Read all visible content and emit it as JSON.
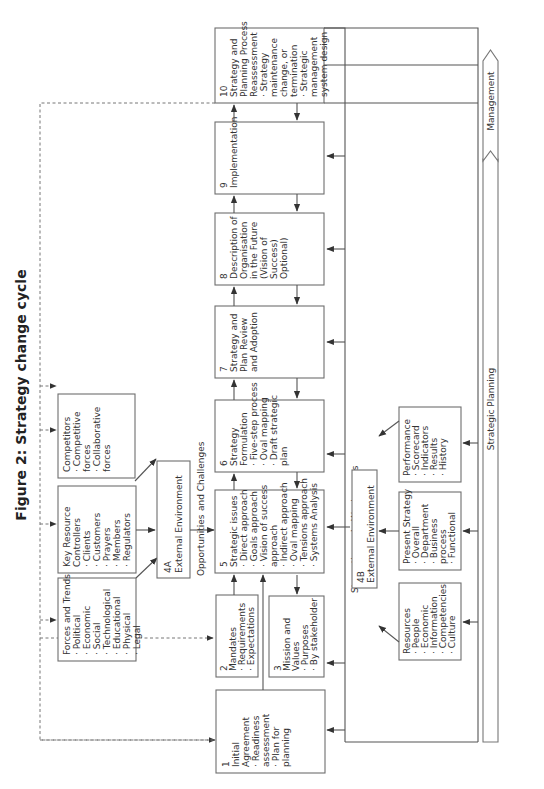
{
  "title": "Figure 2: Strategy change cycle",
  "boxes": {
    "b1": {
      "num": "1",
      "lines": [
        "Initial",
        "Agreement",
        "· Readiness",
        "  assessment",
        "· Plan for",
        "  planning"
      ]
    },
    "b2": {
      "num": "2",
      "lines": [
        "Mandates",
        "· Requirements",
        "· Expectations"
      ]
    },
    "b3": {
      "num": "3",
      "lines": [
        "Mission and",
        "Values",
        "· Purposes",
        "· By stakeholder"
      ]
    },
    "b4a": {
      "num": "4A",
      "lines": [
        "External Environment"
      ]
    },
    "b4b": {
      "num": "4B",
      "lines": [
        "External Environment"
      ]
    },
    "b5": {
      "num": "5",
      "lines": [
        "Strategic issues",
        "· Direct approach",
        "· Goals approach",
        "· Vision of success",
        "  approach",
        "· Indirect approach",
        "· Oval mapping",
        "· Tensions approach",
        "· Systems Analysis"
      ]
    },
    "b6": {
      "num": "6",
      "lines": [
        "Strategy",
        "Formulation",
        "· Five-step process",
        "· Oval mapping",
        "· Draft strategic",
        "  plan"
      ]
    },
    "b7": {
      "num": "7",
      "lines": [
        "Strategy and",
        "Plan Review",
        "and Adoption"
      ]
    },
    "b8": {
      "num": "8",
      "lines": [
        "Description of",
        "Organisation",
        "in the Future",
        "",
        "(Vision of",
        "Success)",
        "Optional)"
      ]
    },
    "b9": {
      "num": "9",
      "lines": [
        "Implementation"
      ]
    },
    "b10": {
      "num": "10",
      "lines": [
        "Strategy and",
        "Planning Process",
        "Reassessment",
        "· Strategy",
        "  maintenance",
        "  change, or",
        "  termination",
        "· Strategic",
        "  management",
        "  system design"
      ]
    },
    "forces": {
      "lines": [
        "Forces and Trends",
        "· Political",
        "· Economic",
        "· Social",
        "· Technological",
        "· Educational",
        "· Physical",
        "· Legal"
      ]
    },
    "keyres": {
      "lines": [
        "Key Resource",
        "Controllers",
        "· Clients",
        "· Customers",
        "· Prayers",
        "· Members",
        "· Regulators"
      ]
    },
    "competitors": {
      "lines": [
        "Competitors",
        "· Competitive",
        "  forces",
        "· Collaborative",
        "  forces"
      ]
    },
    "resources": {
      "lines": [
        "Resources",
        "· People",
        "· Economic",
        "· Information",
        "· Competencies",
        "· Culture"
      ]
    },
    "present": {
      "lines": [
        "Present Strategy",
        "· Overall",
        "· Department",
        "· Business",
        "  process",
        "· Functional"
      ]
    },
    "performance": {
      "lines": [
        "Performance",
        "· Scorecard",
        "· Indicators",
        "· Results",
        "· History"
      ]
    }
  },
  "labels": {
    "opportunities": "Opportunities",
    "challenges": "and Challenges",
    "strengths": "Strengths and",
    "weaknesses": "Weaknesses"
  },
  "bands": {
    "management": "Management",
    "strategic_planning": "Strategic Planning"
  }
}
